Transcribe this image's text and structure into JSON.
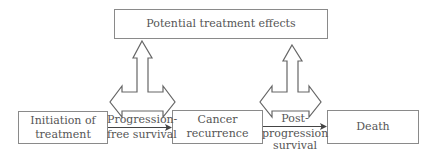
{
  "diagram": {
    "top_box": {
      "label": "Potential treatment effects"
    },
    "states": [
      {
        "id": "initiation",
        "label_line1": "Initiation of",
        "label_line2": "treatment"
      },
      {
        "id": "recurrence",
        "label_line1": "Cancer",
        "label_line2": "recurrence"
      },
      {
        "id": "death",
        "label_line1": "Death",
        "label_line2": ""
      }
    ],
    "transitions": [
      {
        "from": "initiation",
        "to": "recurrence",
        "label_line1": "Progression-",
        "label_line2": "free survival",
        "label_line3": ""
      },
      {
        "from": "recurrence",
        "to": "death",
        "label_line1": "Post-",
        "label_line2": "progression",
        "label_line3": "survival"
      }
    ],
    "colors": {
      "stroke": "#666666",
      "text": "#555555",
      "background": "#ffffff"
    }
  }
}
